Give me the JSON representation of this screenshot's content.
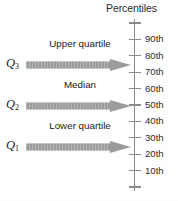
{
  "figure": {
    "type": "percentile-quartile-diagram",
    "background_color": "#ffffff",
    "axis_color": "#8a8a8a",
    "arrow_color": "#9a9a9a",
    "text_color": "#1a1a1a"
  },
  "axis": {
    "title": "Percentiles",
    "orientation": "vertical",
    "tick_count": 11,
    "ticks": [
      {
        "label": "",
        "percentile": 100
      },
      {
        "label": "90th",
        "percentile": 90
      },
      {
        "label": "80th",
        "percentile": 80
      },
      {
        "label": "70th",
        "percentile": 70
      },
      {
        "label": "60th",
        "percentile": 60
      },
      {
        "label": "50th",
        "percentile": 50
      },
      {
        "label": "40th",
        "percentile": 40
      },
      {
        "label": "30th",
        "percentile": 30
      },
      {
        "label": "20th",
        "percentile": 20
      },
      {
        "label": "10th",
        "percentile": 10
      },
      {
        "label": "",
        "percentile": 0
      }
    ]
  },
  "quartiles": [
    {
      "symbol": "Q",
      "subscript": "3",
      "caption": "Upper quartile",
      "percentile": 75
    },
    {
      "symbol": "Q",
      "subscript": "2",
      "caption": "Median",
      "percentile": 50
    },
    {
      "symbol": "Q",
      "subscript": "1",
      "caption": "Lower quartile",
      "percentile": 25
    }
  ],
  "chart_data": {
    "type": "table",
    "title": "Percentiles",
    "categories": [
      "Q1 (Lower quartile)",
      "Q2 (Median)",
      "Q3 (Upper quartile)"
    ],
    "values": [
      25,
      50,
      75
    ],
    "ylabel": "Percentiles",
    "ytick_labels": [
      "10th",
      "20th",
      "30th",
      "40th",
      "50th",
      "60th",
      "70th",
      "80th",
      "90th"
    ],
    "ylim": [
      0,
      100
    ],
    "grid": false,
    "legend": "none"
  }
}
